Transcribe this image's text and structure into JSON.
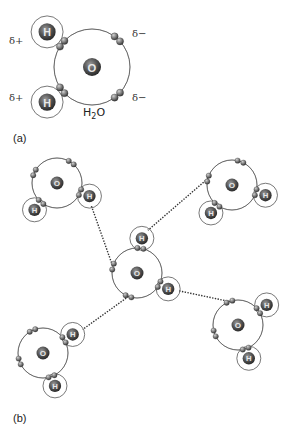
{
  "figure": {
    "panel_a": {
      "label": "(a)",
      "molecule_label": "H₂O",
      "molecule_label_main": "H",
      "molecule_label_sub": "2",
      "molecule_label_end": "O",
      "charges": {
        "h_top": "δ+",
        "h_bottom": "δ+",
        "lone_pair_top": "δ−",
        "lone_pair_bottom": "δ−"
      },
      "atoms": {
        "oxygen": "O",
        "hydrogen": "H"
      }
    },
    "panel_b": {
      "label": "(b)",
      "molecule_count": 5,
      "hydrogen_bond_count": 4,
      "atoms": {
        "oxygen": "O",
        "hydrogen": "H"
      }
    }
  },
  "colors": {
    "nucleus": "#4a4a4a",
    "electron": "#6a6a6a",
    "shell": "#555555",
    "hydrogen_bond": "#333333"
  }
}
